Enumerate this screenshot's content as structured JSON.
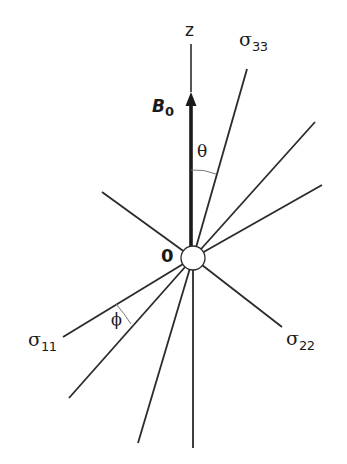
{
  "diagram": {
    "title": "",
    "colors": {
      "line": "#2a2a2a",
      "arc": "#777777",
      "background": "#ffffff"
    },
    "labels": {
      "z_axis": "z",
      "b0_main": "B",
      "b0_sub": "0",
      "origin": "0",
      "theta": "θ",
      "phi": "ϕ",
      "sigma33_main": "σ",
      "sigma33_sub": "33",
      "sigma22_main": "σ",
      "sigma22_sub": "22",
      "sigma11_main": "σ",
      "sigma11_sub": "11"
    },
    "center": {
      "x": 193,
      "y": 258,
      "r": 12
    },
    "rays": [
      {
        "name": "sigma33-axis",
        "x2": 247,
        "y2": 69
      },
      {
        "name": "ray-upper-right-1",
        "x2": 315,
        "y2": 122
      },
      {
        "name": "ray-upper-right-2",
        "x2": 322,
        "y2": 185
      },
      {
        "name": "sigma22-axis",
        "x2": 282,
        "y2": 327
      },
      {
        "name": "ray-upper-left",
        "x2": 102,
        "y2": 192
      },
      {
        "name": "sigma11-axis",
        "x2": 63,
        "y2": 337
      },
      {
        "name": "ray-lower-left",
        "x2": 69,
        "y2": 398
      },
      {
        "name": "ray-lower-middle",
        "x2": 138,
        "y2": 443
      },
      {
        "name": "ray-down",
        "x2": 193,
        "y2": 448
      }
    ]
  }
}
